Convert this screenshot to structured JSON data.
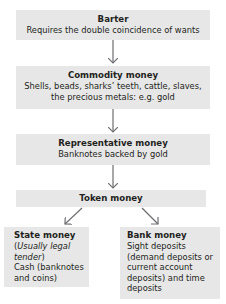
{
  "diagram": {
    "colors": {
      "box_fill": "#e7e7e7",
      "text": "#231f20",
      "arrow": "#6d6e71"
    },
    "nodes": [
      {
        "id": "barter",
        "title": "Barter",
        "desc": "Requires the double coincidence of wants"
      },
      {
        "id": "commodity",
        "title": "Commodity money",
        "desc_line1": "Shells, beads, sharks’ teeth, cattle, slaves,",
        "desc_line2": "the precious metals: e.g. gold"
      },
      {
        "id": "representative",
        "title": "Representative money",
        "desc": "Banknotes backed by gold"
      },
      {
        "id": "token",
        "title": "Token money"
      },
      {
        "id": "state",
        "title": "State money",
        "paren_open": "(",
        "italic": "Usually legal tender",
        "paren_close": ")",
        "desc": "Cash (banknotes and coins)"
      },
      {
        "id": "bank",
        "title": "Bank money",
        "desc": "Sight deposits (demand deposits or current account deposits) and time deposits"
      }
    ],
    "edges": [
      {
        "from": "barter",
        "to": "commodity"
      },
      {
        "from": "commodity",
        "to": "representative"
      },
      {
        "from": "representative",
        "to": "token"
      },
      {
        "from": "token",
        "to": "state"
      },
      {
        "from": "token",
        "to": "bank"
      }
    ]
  }
}
